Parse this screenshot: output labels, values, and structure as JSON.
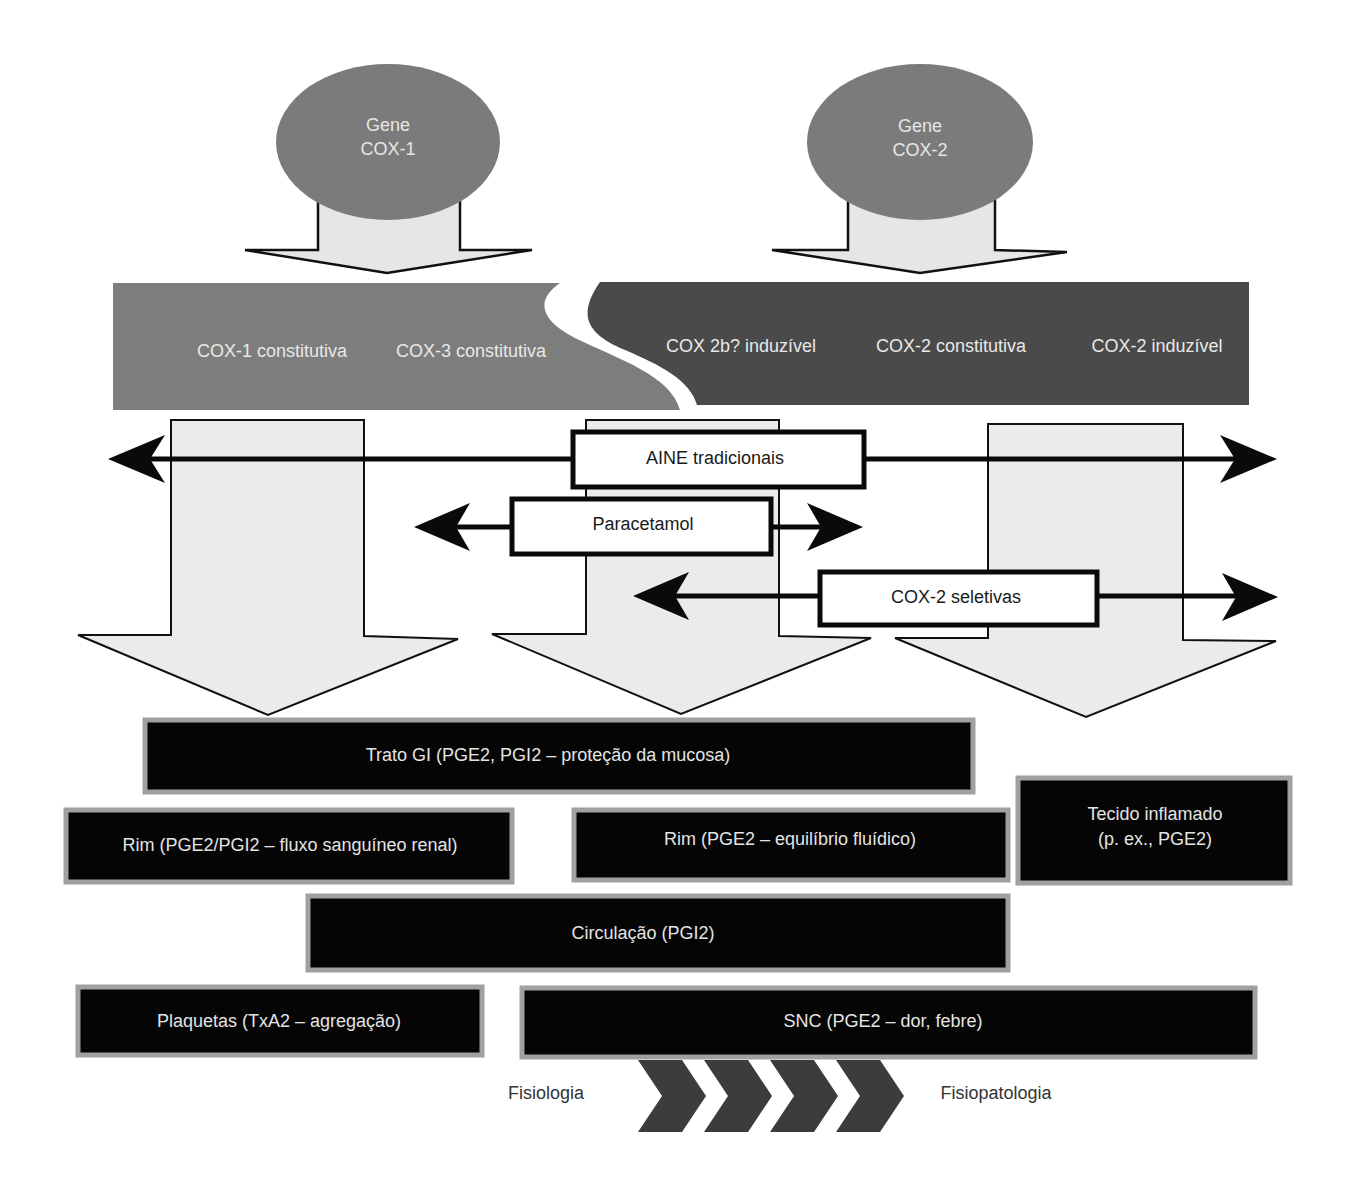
{
  "genes": [
    {
      "id": "cox1",
      "line1": "Gene",
      "line2": "COX-1"
    },
    {
      "id": "cox2",
      "line1": "Gene",
      "line2": "COX-2"
    }
  ],
  "isoforms": {
    "cox1_band": [
      {
        "label": "COX-1 constitutiva"
      },
      {
        "label": "COX-3 constitutiva"
      }
    ],
    "cox2_band": [
      {
        "label": "COX 2b? induzível"
      },
      {
        "label": "COX-2 constitutiva"
      },
      {
        "label": "COX-2 induzível"
      }
    ]
  },
  "drugs": [
    {
      "id": "aine",
      "label": "AINE tradicionais"
    },
    {
      "id": "paracetamol",
      "label": "Paracetamol"
    },
    {
      "id": "cox2sel",
      "label": "COX-2 seletivas"
    }
  ],
  "tissues": [
    {
      "id": "gi",
      "label": "Trato GI (PGE2, PGI2 – proteção da mucosa)"
    },
    {
      "id": "rim1",
      "label": "Rim (PGE2/PGI2 – fluxo sanguíneo renal)"
    },
    {
      "id": "rim2",
      "label": "Rim (PGE2 – equilíbrio fluídico)"
    },
    {
      "id": "inflamado",
      "line1": "Tecido inflamado",
      "line2": "(p. ex., PGE2)"
    },
    {
      "id": "circulacao",
      "label": "Circulação (PGI2)"
    },
    {
      "id": "plaquetas",
      "label": "Plaquetas (TxA2 – agregação)"
    },
    {
      "id": "snc",
      "label": "SNC (PGE2 – dor, febre)"
    }
  ],
  "axis": {
    "left_label": "Fisiologia",
    "right_label": "Fisiopatologia",
    "chevron_count": 4
  },
  "colors": {
    "gene_fill": "#7b7b7b",
    "cox1_band": "#7d7d7d",
    "cox2_band": "#4a4a4a",
    "arrow_fill": "#ebebeb",
    "tissue_fill": "#050505",
    "tissue_border": "#a0a0a0",
    "chevron_fill": "#3c3c3c"
  }
}
